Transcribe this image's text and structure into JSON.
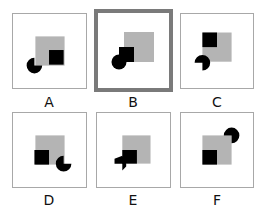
{
  "puzzle": {
    "options": [
      {
        "id": "A",
        "label": "A",
        "selected": false
      },
      {
        "id": "B",
        "label": "B",
        "selected": true
      },
      {
        "id": "C",
        "label": "C",
        "selected": false
      },
      {
        "id": "D",
        "label": "D",
        "selected": false
      },
      {
        "id": "E",
        "label": "E",
        "selected": false
      },
      {
        "id": "F",
        "label": "F",
        "selected": false
      }
    ],
    "colors": {
      "large_square": "#b4b4b4",
      "small_square": "#000000",
      "pacman": "#000000",
      "frame": "#a8a8a8",
      "selected_frame": "#7a7a7a"
    }
  }
}
